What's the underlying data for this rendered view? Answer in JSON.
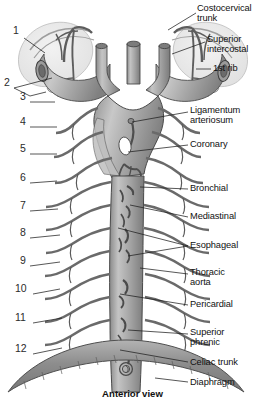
{
  "figure": {
    "title": "Anterior view",
    "view_caption": "Anterior view",
    "colors": {
      "vessel_fill": "#9a9a9a",
      "vessel_fill_light": "#c9c9c9",
      "vessel_fill_dark": "#7b7b7b",
      "outline": "#3a3a3a",
      "leader_line": "#1f1f1f",
      "background": "#ffffff",
      "text": "#111111",
      "lung_tint": "#e8e8e8",
      "diaphragm": "#8c8c8c"
    }
  },
  "right_labels": [
    {
      "id": "costocervical-trunk",
      "text": "Costocervical\ntrunk",
      "x": 197,
      "y": 4,
      "leader": [
        [
          196,
          13
        ],
        [
          168,
          30
        ]
      ]
    },
    {
      "id": "superior-intercostal",
      "text": "Superior\nintercostal",
      "x": 207,
      "y": 35,
      "leader": [
        [
          205,
          42
        ],
        [
          172,
          54
        ]
      ]
    },
    {
      "id": "first-rib",
      "text": "1st rib",
      "x": 213,
      "y": 64,
      "leader": [
        [
          211,
          69
        ],
        [
          196,
          69
        ]
      ]
    },
    {
      "id": "ligamentum-arteriosum",
      "text": "Ligamentum\narteriosum",
      "x": 190,
      "y": 106,
      "leader": [
        [
          188,
          112
        ],
        [
          132,
          122
        ]
      ]
    },
    {
      "id": "coronary",
      "text": "Coronary",
      "x": 190,
      "y": 140,
      "leader": [
        [
          188,
          145
        ],
        [
          128,
          152
        ]
      ]
    },
    {
      "id": "bronchial",
      "text": "Bronchial",
      "x": 190,
      "y": 184,
      "leader": [
        [
          188,
          189
        ],
        [
          140,
          187
        ]
      ]
    },
    {
      "id": "mediastinal",
      "text": "Mediastinal",
      "x": 190,
      "y": 212,
      "leader": [
        [
          188,
          217
        ],
        [
          130,
          205
        ]
      ]
    },
    {
      "id": "esophageal",
      "text": "Esophageal",
      "x": 190,
      "y": 241,
      "leader": [
        [
          188,
          246
        ],
        [
          118,
          228
        ]
      ]
    },
    {
      "id": "thoracic-aorta",
      "text": "Thoracic\naorta",
      "x": 190,
      "y": 268,
      "leader": [
        [
          188,
          274
        ],
        [
          140,
          268
        ]
      ]
    },
    {
      "id": "pericardial",
      "text": "Pericardial",
      "x": 190,
      "y": 300,
      "leader": [
        [
          188,
          305
        ],
        [
          120,
          294
        ]
      ]
    },
    {
      "id": "superior-phrenic",
      "text": "Superior\nphrenic",
      "x": 190,
      "y": 328,
      "leader": [
        [
          188,
          334
        ],
        [
          128,
          330
        ]
      ]
    },
    {
      "id": "celiac-trunk",
      "text": "Celiac trunk",
      "x": 190,
      "y": 358,
      "leader": [
        [
          188,
          362
        ],
        [
          120,
          350
        ]
      ]
    },
    {
      "id": "diaphragm",
      "text": "Diaphragm",
      "x": 190,
      "y": 378,
      "leader": [
        [
          188,
          382
        ],
        [
          155,
          378
        ]
      ]
    }
  ],
  "left_numbers": [
    {
      "id": "num-1",
      "text": "1",
      "x": 13,
      "y": 30,
      "leader": [
        [
          24,
          38
        ],
        [
          45,
          53
        ]
      ]
    },
    {
      "id": "num-2",
      "text": "2",
      "x": 4,
      "y": 82,
      "leader": [
        [
          14,
          88
        ],
        [
          52,
          78
        ]
      ]
    },
    {
      "id": "num-3",
      "text": "3",
      "x": 20,
      "y": 96,
      "leader": [
        [
          30,
          102
        ],
        [
          55,
          102
        ]
      ]
    },
    {
      "id": "num-4",
      "text": "4",
      "x": 20,
      "y": 121,
      "leader": [
        [
          30,
          127
        ],
        [
          57,
          127
        ]
      ]
    },
    {
      "id": "num-5",
      "text": "5",
      "x": 20,
      "y": 148,
      "leader": [
        [
          30,
          154
        ],
        [
          57,
          154
        ]
      ]
    },
    {
      "id": "num-6",
      "text": "6",
      "x": 20,
      "y": 177,
      "leader": [
        [
          30,
          183
        ],
        [
          57,
          181
        ]
      ]
    },
    {
      "id": "num-7",
      "text": "7",
      "x": 20,
      "y": 205,
      "leader": [
        [
          30,
          211
        ],
        [
          58,
          209
        ]
      ]
    },
    {
      "id": "num-8",
      "text": "8",
      "x": 20,
      "y": 232,
      "leader": [
        [
          30,
          238
        ],
        [
          60,
          235
        ]
      ]
    },
    {
      "id": "num-9",
      "text": "9",
      "x": 20,
      "y": 260,
      "leader": [
        [
          30,
          266
        ],
        [
          60,
          262
        ]
      ]
    },
    {
      "id": "num-10",
      "text": "10",
      "x": 15,
      "y": 288,
      "leader": [
        [
          31,
          294
        ],
        [
          60,
          289
        ]
      ]
    },
    {
      "id": "num-11",
      "text": "11",
      "x": 15,
      "y": 317,
      "leader": [
        [
          31,
          323
        ],
        [
          62,
          318
        ]
      ]
    },
    {
      "id": "num-12",
      "text": "12",
      "x": 15,
      "y": 348,
      "leader": [
        [
          31,
          354
        ],
        [
          62,
          348
        ]
      ]
    }
  ],
  "structures": {
    "aortic_arch": "aortic-arch",
    "descending_aorta": "descending-thoracic-aorta",
    "subclavian_left": "left-subclavian-artery",
    "subclavian_right": "right-subclavian-artery",
    "common_carotid_left": "left-common-carotid-artery",
    "brachiocephalic": "brachiocephalic-trunk",
    "intercostal_count_left": 11,
    "intercostal_count_right": 11
  }
}
